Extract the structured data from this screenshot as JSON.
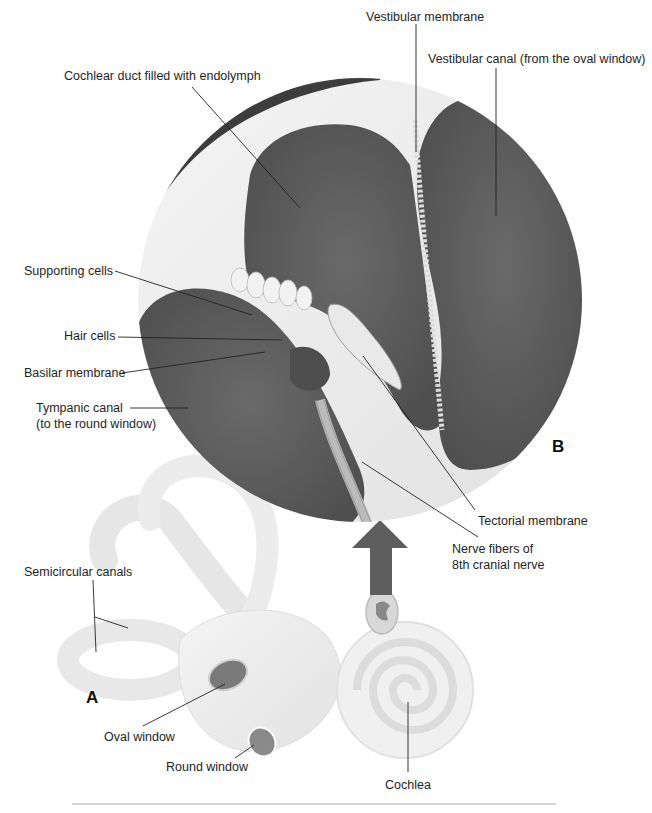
{
  "figure": {
    "panel_labels": {
      "a": "A",
      "b": "B"
    },
    "colors": {
      "fluid_dark": "#5a5a5a",
      "fluid_mid": "#666666",
      "tissue_light": "#e8e8e8",
      "bone_pale": "#eeeeee",
      "leader_line": "#222222",
      "rule": "#d4d4d4"
    },
    "labels": {
      "vestibular_membrane": "Vestibular membrane",
      "vestibular_canal": "Vestibular canal (from the oval window)",
      "cochlear_duct": "Cochlear duct filled with endolymph",
      "supporting_cells": "Supporting cells",
      "hair_cells": "Hair cells",
      "basilar_membrane": "Basilar membrane",
      "tympanic_canal_line1": "Tympanic canal",
      "tympanic_canal_line2": "(to the round window)",
      "tectorial_membrane": "Tectorial membrane",
      "nerve_fibers_line1": "Nerve fibers of",
      "nerve_fibers_line2": "8th cranial nerve",
      "semicircular_canals": "Semicircular canals",
      "oval_window": "Oval window",
      "round_window": "Round window",
      "cochlea": "Cochlea"
    }
  }
}
